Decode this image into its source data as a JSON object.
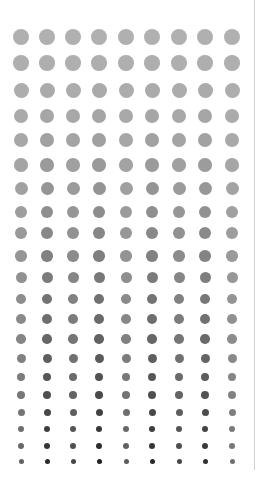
{
  "grid": {
    "columns_x": [
      21,
      47,
      73,
      99,
      126,
      152,
      179,
      205,
      232
    ],
    "rows": [
      {
        "y": 37,
        "d": 16,
        "gray": 176
      },
      {
        "y": 63,
        "d": 15.5,
        "gray": 174
      },
      {
        "y": 90,
        "d": 15,
        "gray": 170
      },
      {
        "y": 116,
        "d": 14.5,
        "gray": 165
      },
      {
        "y": 140,
        "d": 14,
        "gray": 160
      },
      {
        "y": 165,
        "d": 13.5,
        "gray": 154
      },
      {
        "y": 188,
        "d": 13,
        "gray": 148
      },
      {
        "y": 212,
        "d": 12.5,
        "gray": 141
      },
      {
        "y": 233,
        "d": 12,
        "gray": 134
      },
      {
        "y": 256,
        "d": 11.5,
        "gray": 127
      },
      {
        "y": 277,
        "d": 11,
        "gray": 120
      },
      {
        "y": 299,
        "d": 10.5,
        "gray": 113
      },
      {
        "y": 319,
        "d": 10,
        "gray": 106
      },
      {
        "y": 339,
        "d": 9.5,
        "gray": 98
      },
      {
        "y": 358,
        "d": 9,
        "gray": 90
      },
      {
        "y": 377,
        "d": 8.5,
        "gray": 82
      },
      {
        "y": 395,
        "d": 8,
        "gray": 74
      },
      {
        "y": 412,
        "d": 7,
        "gray": 66
      },
      {
        "y": 429,
        "d": 6.5,
        "gray": 56
      },
      {
        "y": 446,
        "d": 6,
        "gray": 46
      },
      {
        "y": 461,
        "d": 5,
        "gray": 34
      }
    ],
    "column_darkness": [
      0.55,
      0.95,
      0.75,
      1.0,
      0.6,
      0.95,
      0.75,
      0.9,
      0.45
    ]
  },
  "divider": {
    "x": 254,
    "height": 470,
    "color": "#cfcfcf"
  },
  "background": "#ffffff"
}
